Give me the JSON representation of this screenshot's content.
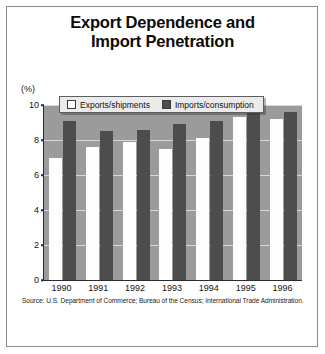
{
  "figure": {
    "title_line1": "Export Dependence and",
    "title_line2": "Import Penetration",
    "unit_label": "(%)",
    "source": "Source: U.S. Department of Commerce; Bureau of the Census; International Trade Administration."
  },
  "legend": {
    "items": [
      {
        "label": "Exports/shipments",
        "swatch": "white",
        "color": "#ffffff"
      },
      {
        "label": "Imports/consumption",
        "swatch": "dark",
        "color": "#4d4d4d"
      }
    ]
  },
  "colors": {
    "plot_background": "#9b9b9b",
    "exports_bar": "#fdfdfd",
    "imports_bar": "#4d4d4d",
    "gridline": "#d8d8d8",
    "axis": "#2b2b2b",
    "legend_background": "#ebebeb"
  },
  "chart_data": {
    "type": "bar",
    "title": "Export Dependence and Import Penetration",
    "xlabel": "",
    "ylabel": "(%)",
    "ylim": [
      0,
      10
    ],
    "yticks": [
      0,
      2,
      4,
      6,
      8,
      10
    ],
    "ytick_labels": [
      "0",
      "2",
      "4",
      "6",
      "8",
      "10"
    ],
    "grid": true,
    "legend_position": "top-inside",
    "categories": [
      "1990",
      "1991",
      "1992",
      "1993",
      "1994",
      "1995",
      "1996"
    ],
    "series": [
      {
        "name": "Exports/shipments",
        "values": [
          7.0,
          7.6,
          7.9,
          7.5,
          8.1,
          9.3,
          9.2
        ]
      },
      {
        "name": "Imports/consumption",
        "values": [
          9.1,
          8.5,
          8.6,
          8.9,
          9.1,
          9.9,
          9.6
        ]
      }
    ]
  }
}
